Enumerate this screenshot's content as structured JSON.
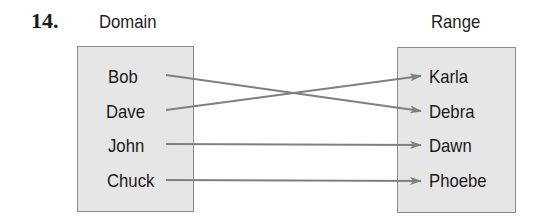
{
  "problem_number": "14.",
  "domain": {
    "title": "Domain",
    "items": [
      "Bob",
      "Dave",
      "John",
      "Chuck"
    ]
  },
  "range": {
    "title": "Range",
    "items": [
      "Karla",
      "Debra",
      "Dawn",
      "Phoebe"
    ]
  },
  "mapping": [
    {
      "from": "Bob",
      "to": "Debra"
    },
    {
      "from": "Dave",
      "to": "Karla"
    },
    {
      "from": "John",
      "to": "Dawn"
    },
    {
      "from": "Chuck",
      "to": "Phoebe"
    }
  ],
  "colors": {
    "box_fill": "#e6e6e6",
    "box_border": "#8a8a8a",
    "arrow": "#808080",
    "text": "#1a1a1a"
  }
}
